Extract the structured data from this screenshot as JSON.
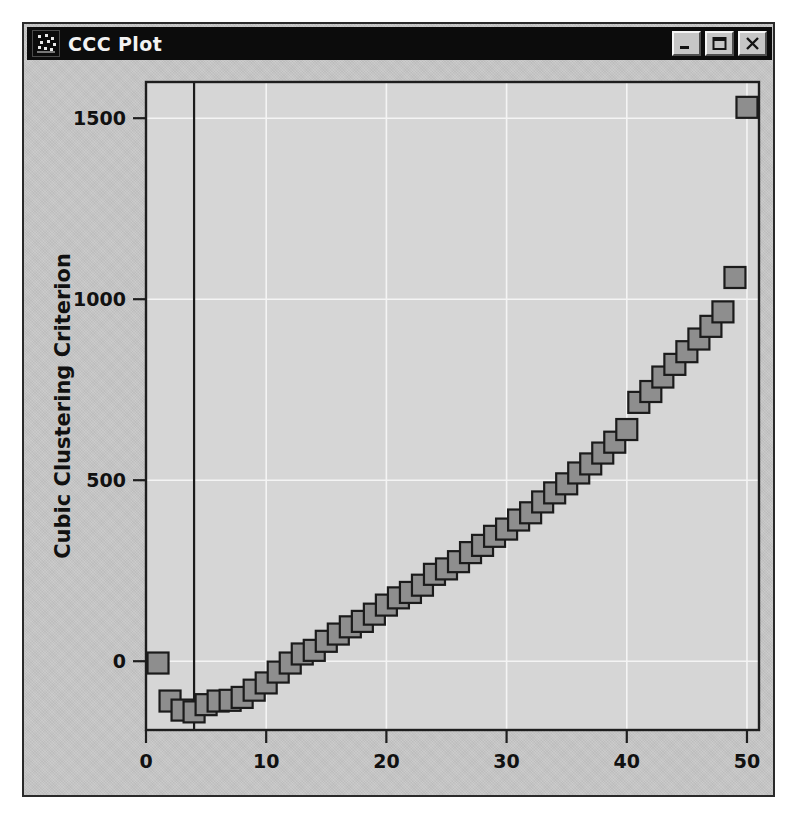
{
  "window": {
    "title": "CCC Plot",
    "icon": "scatter-plot-icon",
    "controls": [
      {
        "name": "minimize-button",
        "label": "Minimize"
      },
      {
        "name": "maximize-button",
        "label": "Maximize"
      },
      {
        "name": "close-button",
        "label": "Close"
      }
    ]
  },
  "colors": {
    "titlebar_bg": "#0c0c0c",
    "titlebar_fg": "#f2f2f2",
    "window_bg": "#c9c9c9",
    "plot_bg": "#d6d6d6",
    "marker_fill": "#8e8e8e",
    "marker_stroke": "#1b1b1b",
    "gridline": "#f4f4f4",
    "axis": "#1e1e1e"
  },
  "chart_data": {
    "type": "scatter",
    "title": "CCC Plot",
    "xlabel": "Number of Clusters",
    "ylabel": "Cubic Clustering Criterion",
    "xlim": [
      0,
      51
    ],
    "ylim": [
      -190,
      1600
    ],
    "xticks": [
      0,
      10,
      20,
      30,
      40,
      50
    ],
    "yticks": [
      0,
      500,
      1000,
      1500
    ],
    "xticklabels": [
      "0",
      "10",
      "20",
      "30",
      "40",
      "50"
    ],
    "yticklabels": [
      "0",
      "500",
      "1000",
      "1500"
    ],
    "grid": true,
    "legend": null,
    "reference_line": {
      "axis": "x",
      "value": 4
    },
    "marker": {
      "shape": "square",
      "size": 21
    },
    "x": [
      1,
      2,
      3,
      4,
      5,
      6,
      7,
      8,
      9,
      10,
      11,
      12,
      13,
      14,
      15,
      16,
      17,
      18,
      19,
      20,
      21,
      22,
      23,
      24,
      25,
      26,
      27,
      28,
      29,
      30,
      31,
      32,
      33,
      34,
      35,
      36,
      37,
      38,
      39,
      40,
      41,
      42,
      43,
      44,
      45,
      46,
      47,
      48,
      49,
      50
    ],
    "y": [
      -5,
      -110,
      -135,
      -140,
      -120,
      -110,
      -108,
      -100,
      -80,
      -60,
      -30,
      -5,
      20,
      30,
      55,
      75,
      95,
      110,
      130,
      155,
      175,
      190,
      210,
      240,
      255,
      275,
      300,
      320,
      345,
      365,
      390,
      410,
      440,
      465,
      490,
      520,
      545,
      575,
      605,
      640,
      715,
      745,
      785,
      820,
      855,
      890,
      925,
      965,
      1060,
      1530
    ]
  }
}
